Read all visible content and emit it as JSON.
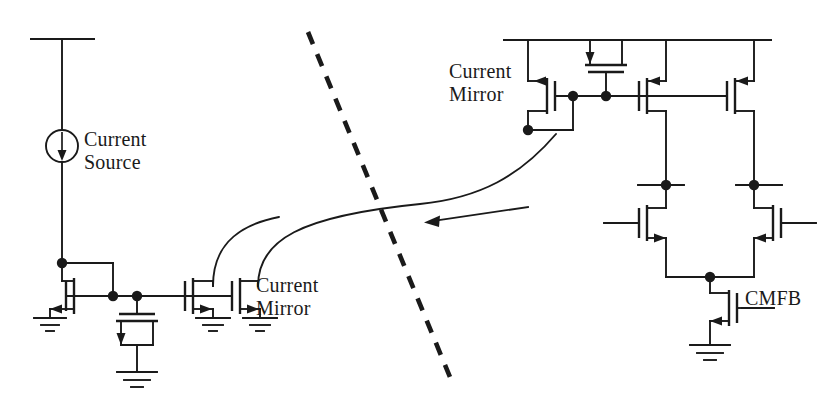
{
  "figure": {
    "domain": "circuit-schematic",
    "width": 840,
    "height": 409,
    "background_color": "#ffffff",
    "ink_color": "#1a1a1a"
  },
  "labels": {
    "current_source": "Current\nSource",
    "current_mirror_left": "Current\nMirror",
    "current_mirror_right": "Current\nMirror",
    "cmfb": "CMFB"
  },
  "annotations": {
    "divider": {
      "name": "dashed-divider-line",
      "style": "dashed",
      "from": [
        308,
        32
      ],
      "to": [
        452,
        382
      ]
    },
    "pointer_arrow": {
      "name": "left-pointing-arrow",
      "direction": "left",
      "from": [
        528,
        208
      ],
      "to": [
        425,
        222
      ]
    },
    "signal_curves": [
      {
        "name": "mirror-drain-curve-1",
        "from": [
          213,
          284
        ],
        "to": [
          278,
          217
        ]
      },
      {
        "name": "mirror-drain-curve-2",
        "from": [
          258,
          284
        ],
        "to": [
          556,
          134
        ]
      }
    ]
  },
  "blocks": {
    "bias_branch": {
      "name": "bias-current-branch",
      "supply_rail": {
        "x1": 30,
        "x2": 95,
        "y": 39
      },
      "current_source": {
        "cx": 62,
        "cy": 146,
        "r": 16,
        "arrow": "down"
      },
      "diode_nmos": {
        "name": "M-bias-diode",
        "type": "nmos",
        "diode_connected": true
      },
      "mos_capacitor": {
        "name": "M-cap-bias",
        "type": "mos-capacitor"
      }
    },
    "left_current_mirror": {
      "name": "left-current-mirror",
      "transistors": [
        {
          "name": "M-mirror-out-1",
          "type": "nmos"
        },
        {
          "name": "M-mirror-out-2",
          "type": "nmos"
        }
      ]
    },
    "right_current_mirror": {
      "name": "right-current-mirror",
      "supply_rail": {
        "x1": 503,
        "x2": 772,
        "y": 40
      },
      "transistors": [
        {
          "name": "M-pmos-diode",
          "type": "pmos",
          "diode_connected": true
        },
        {
          "name": "M-pmos-load-left",
          "type": "pmos"
        },
        {
          "name": "M-pmos-load-right",
          "type": "pmos"
        }
      ],
      "mos_capacitor": {
        "name": "M-cap-comp",
        "type": "mos-capacitor"
      }
    },
    "differential_pair": {
      "name": "nmos-differential-pair",
      "transistors": [
        {
          "name": "M-diff-left",
          "type": "nmos"
        },
        {
          "name": "M-diff-right",
          "type": "nmos"
        }
      ],
      "tail": {
        "name": "M-cmfb-tail",
        "type": "nmos",
        "gate_label": "CMFB"
      }
    },
    "grounds": [
      {
        "name": "ground-bias-nmos",
        "x": 62,
        "y": 318
      },
      {
        "name": "ground-mos-cap",
        "x": 135,
        "y": 360
      },
      {
        "name": "ground-mirror-1",
        "x": 190,
        "y": 318
      },
      {
        "name": "ground-mirror-2",
        "x": 238,
        "y": 318
      },
      {
        "name": "ground-cmfb",
        "x": 712,
        "y": 345
      }
    ]
  }
}
